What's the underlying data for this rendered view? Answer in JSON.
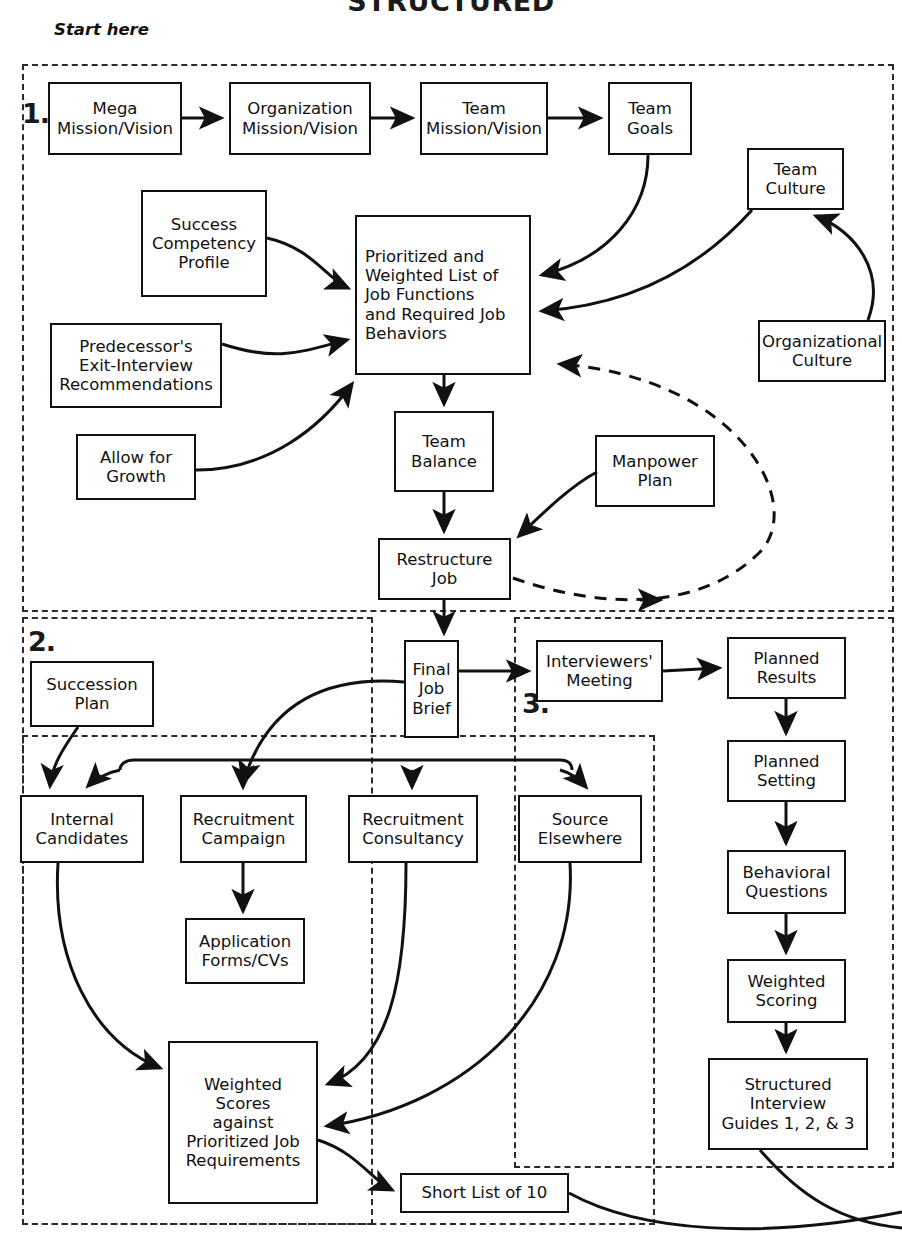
{
  "title": "STRUCTURED",
  "start_label": "Start here",
  "zones": [
    {
      "id": "zone-1",
      "number": "1."
    },
    {
      "id": "zone-2",
      "number": "2."
    },
    {
      "id": "zone-3",
      "number": "3."
    }
  ],
  "nodes": {
    "mega_mission": "Mega\nMission/Vision",
    "org_mission": "Organization\nMission/Vision",
    "team_mission": "Team\nMission/Vision",
    "team_goals": "Team\nGoals",
    "team_culture": "Team\nCulture",
    "org_culture": "Organizational\nCulture",
    "success_competency": "Success\nCompetency\nProfile",
    "predecessor_exit": "Predecessor's\nExit-Interview\nRecommendations",
    "allow_growth": "Allow for\nGrowth",
    "prioritized_list": "Prioritized and\nWeighted List of\nJob Functions\nand Required Job\nBehaviors",
    "team_balance": "Team\nBalance",
    "manpower_plan": "Manpower\nPlan",
    "restructure_job": "Restructure\nJob",
    "final_job_brief": "Final\nJob\nBrief",
    "succession_plan": "Succession\nPlan",
    "internal_candidates": "Internal\nCandidates",
    "recruitment_campaign": "Recruitment\nCampaign",
    "recruitment_consultancy": "Recruitment\nConsultancy",
    "source_elsewhere": "Source\nElsewhere",
    "application_forms": "Application\nForms/CVs",
    "weighted_scores": "Weighted\nScores\nagainst\nPrioritized Job\nRequirements",
    "short_list": "Short List of 10",
    "interviewers_meeting": "Interviewers'\nMeeting",
    "planned_results": "Planned\nResults",
    "planned_setting": "Planned\nSetting",
    "behavioral_questions": "Behavioral\nQuestions",
    "weighted_scoring": "Weighted\nScoring",
    "structured_interview": "Structured\nInterview\nGuides 1, 2, & 3"
  },
  "colors": {
    "ink": "#111111",
    "dash": "#2b2b2b",
    "paper": "#ffffff"
  },
  "chart_data": {
    "type": "diagram",
    "title": "STRUCTURED",
    "nodes": [
      "Mega Mission/Vision",
      "Organization Mission/Vision",
      "Team Mission/Vision",
      "Team Goals",
      "Team Culture",
      "Organizational Culture",
      "Success Competency Profile",
      "Predecessor's Exit-Interview Recommendations",
      "Allow for Growth",
      "Prioritized and Weighted List of Job Functions and Required Job Behaviors",
      "Team Balance",
      "Manpower Plan",
      "Restructure Job",
      "Final Job Brief",
      "Succession Plan",
      "Internal Candidates",
      "Recruitment Campaign",
      "Recruitment Consultancy",
      "Source Elsewhere",
      "Application Forms/CVs",
      "Weighted Scores against Prioritized Job Requirements",
      "Short List of 10",
      "Interviewers' Meeting",
      "Planned Results",
      "Planned Setting",
      "Behavioral Questions",
      "Weighted Scoring",
      "Structured Interview Guides 1, 2, & 3"
    ],
    "edges": [
      [
        "Mega Mission/Vision",
        "Organization Mission/Vision"
      ],
      [
        "Organization Mission/Vision",
        "Team Mission/Vision"
      ],
      [
        "Team Mission/Vision",
        "Team Goals"
      ],
      [
        "Team Goals",
        "Prioritized and Weighted List of Job Functions and Required Job Behaviors"
      ],
      [
        "Team Culture",
        "Prioritized and Weighted List of Job Functions and Required Job Behaviors"
      ],
      [
        "Organizational Culture",
        "Team Culture"
      ],
      [
        "Success Competency Profile",
        "Prioritized and Weighted List of Job Functions and Required Job Behaviors"
      ],
      [
        "Predecessor's Exit-Interview Recommendations",
        "Prioritized and Weighted List of Job Functions and Required Job Behaviors"
      ],
      [
        "Allow for Growth",
        "Prioritized and Weighted List of Job Functions and Required Job Behaviors"
      ],
      [
        "Prioritized and Weighted List of Job Functions and Required Job Behaviors",
        "Team Balance"
      ],
      [
        "Team Balance",
        "Restructure Job"
      ],
      [
        "Manpower Plan",
        "Restructure Job"
      ],
      [
        "Restructure Job",
        "Prioritized and Weighted List of Job Functions and Required Job Behaviors"
      ],
      [
        "Restructure Job",
        "Final Job Brief"
      ],
      [
        "Final Job Brief",
        "Interviewers' Meeting"
      ],
      [
        "Final Job Brief",
        "Recruitment Campaign"
      ],
      [
        "Succession Plan",
        "Internal Candidates"
      ],
      [
        "Recruitment Campaign",
        "Application Forms/CVs"
      ],
      [
        "Internal Candidates",
        "Weighted Scores against Prioritized Job Requirements"
      ],
      [
        "Recruitment Consultancy",
        "Weighted Scores against Prioritized Job Requirements"
      ],
      [
        "Source Elsewhere",
        "Weighted Scores against Prioritized Job Requirements"
      ],
      [
        "Weighted Scores against Prioritized Job Requirements",
        "Short List of 10"
      ],
      [
        "Interviewers' Meeting",
        "Planned Results"
      ],
      [
        "Planned Results",
        "Planned Setting"
      ],
      [
        "Planned Setting",
        "Behavioral Questions"
      ],
      [
        "Behavioral Questions",
        "Weighted Scoring"
      ],
      [
        "Weighted Scoring",
        "Structured Interview Guides 1, 2, & 3"
      ]
    ],
    "groups": [
      "1.",
      "2.",
      "3."
    ],
    "annotations": [
      "Start here"
    ]
  }
}
